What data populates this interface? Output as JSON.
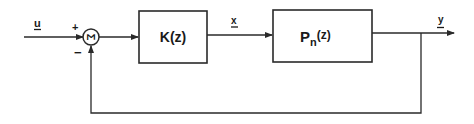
{
  "diagram": {
    "type": "feedback-control-block-diagram",
    "signals": {
      "input": "u",
      "intermediate": "x",
      "output": "y"
    },
    "summing_junction": {
      "symbol": "Σ",
      "plus_sign": "+",
      "minus_sign": "−"
    },
    "blocks": [
      {
        "id": "controller",
        "label": "K(z)"
      },
      {
        "id": "plant",
        "label_main": "P",
        "label_sub": "n",
        "label_arg": "(z)"
      }
    ],
    "colors": {
      "line": "#2a2a2a",
      "text": "#1a1a1a",
      "background": "#ffffff"
    }
  }
}
